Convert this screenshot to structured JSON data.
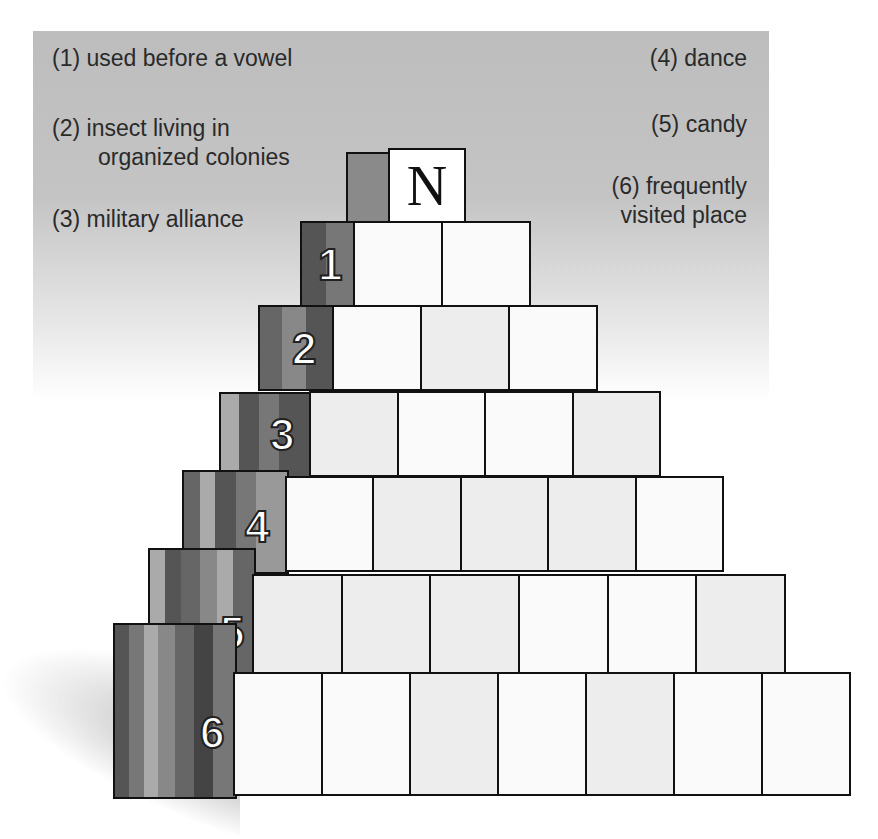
{
  "puzzle": {
    "title_block_letter": "N",
    "clues": [
      {
        "num": "(1)",
        "text": "used before a vowel"
      },
      {
        "num": "(2)",
        "text": "insect living in",
        "text2": "organized colonies"
      },
      {
        "num": "(3)",
        "text": "military alliance"
      },
      {
        "num": "(4)",
        "text": "dance"
      },
      {
        "num": "(5)",
        "text": "candy"
      },
      {
        "num": "(6)",
        "text": "frequently",
        "text2": "visited place"
      }
    ],
    "rows": [
      {
        "label": "1",
        "cells": 2
      },
      {
        "label": "2",
        "cells": 3
      },
      {
        "label": "3",
        "cells": 4
      },
      {
        "label": "4",
        "cells": 5
      },
      {
        "label": "5",
        "cells": 6
      },
      {
        "label": "6",
        "cells": 7
      }
    ]
  }
}
